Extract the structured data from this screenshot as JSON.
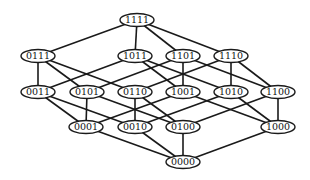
{
  "diagram": {
    "type": "hasse-diagram",
    "levels": [
      [
        "1111"
      ],
      [
        "0111",
        "1011",
        "1101",
        "1110"
      ],
      [
        "0011",
        "0101",
        "0110",
        "1001",
        "1010",
        "1100"
      ],
      [
        "0001",
        "0010",
        "0100",
        "1000"
      ],
      [
        "0000"
      ]
    ],
    "edge_rule": "connect nodes in adjacent levels that differ in exactly one bit",
    "colors": {
      "stroke": "#1a1a1a",
      "fill": "#ffffff",
      "text": "#111111"
    }
  }
}
